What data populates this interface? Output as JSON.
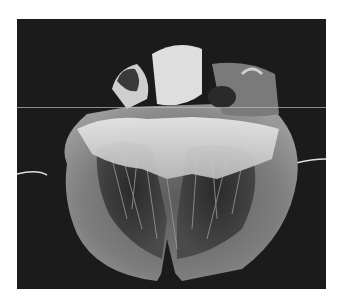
{
  "image": {
    "subject": "dissected heart specimen, four-chamber view",
    "style": "grayscale photograph on black background",
    "colors": {
      "background": "#1b1b1b",
      "border": "#ffffff",
      "tissue_light": "#d8d8d8",
      "tissue_mid": "#8a8a8a",
      "tissue_dark": "#3a3a3a"
    }
  }
}
